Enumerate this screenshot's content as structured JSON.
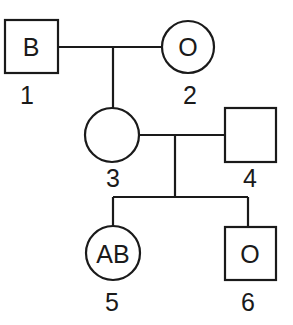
{
  "diagram": {
    "type": "pedigree-chart",
    "individuals": [
      {
        "id": "1",
        "sex": "male",
        "shape": "square",
        "blood_type": "B"
      },
      {
        "id": "2",
        "sex": "female",
        "shape": "circle",
        "blood_type": "O"
      },
      {
        "id": "3",
        "sex": "female",
        "shape": "circle",
        "blood_type": ""
      },
      {
        "id": "4",
        "sex": "male",
        "shape": "square",
        "blood_type": ""
      },
      {
        "id": "5",
        "sex": "female",
        "shape": "circle",
        "blood_type": "AB"
      },
      {
        "id": "6",
        "sex": "male",
        "shape": "square",
        "blood_type": "O"
      }
    ],
    "matings": [
      {
        "parents": [
          "1",
          "2"
        ],
        "children": [
          "3"
        ]
      },
      {
        "parents": [
          "3",
          "4"
        ],
        "children": [
          "5",
          "6"
        ]
      }
    ],
    "colors": {
      "stroke": "#1a1a1a",
      "background": "#ffffff"
    }
  }
}
